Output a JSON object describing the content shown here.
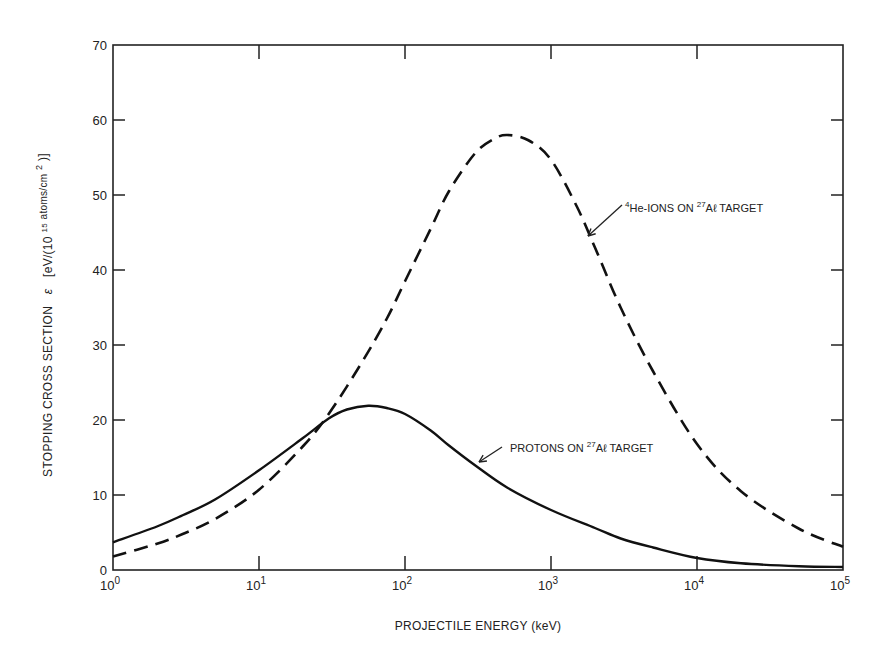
{
  "chart_data": {
    "type": "line",
    "title": "",
    "xlabel": "PROJECTILE ENERGY (keV)",
    "ylabel": "STOPPING CROSS SECTION ε [eV/(10^15 atoms/cm^2)]",
    "ylabel_parts": {
      "main": "STOPPING CROSS SECTION",
      "symbol": "ε",
      "unit_pre": "[eV/(10",
      "unit_exp": "15",
      "unit_mid": " atoms/cm",
      "unit_exp2": "2",
      "unit_post": ")]"
    },
    "xscale": "log",
    "xlim": [
      1,
      100000
    ],
    "ylim": [
      0,
      70
    ],
    "grid": false,
    "x_ticks": [
      {
        "value": 1,
        "base": "10",
        "exp": "0"
      },
      {
        "value": 10,
        "base": "10",
        "exp": "1"
      },
      {
        "value": 100,
        "base": "10",
        "exp": "2"
      },
      {
        "value": 1000,
        "base": "10",
        "exp": "3"
      },
      {
        "value": 10000,
        "base": "10",
        "exp": "4"
      },
      {
        "value": 100000,
        "base": "10",
        "exp": "5"
      }
    ],
    "y_ticks": [
      0,
      10,
      20,
      30,
      40,
      50,
      60,
      70
    ],
    "series": [
      {
        "name": "4He-IONS ON 27Al TARGET",
        "style": "dashed",
        "x": [
          1,
          2,
          3,
          5,
          10,
          20,
          30,
          50,
          75,
          100,
          150,
          200,
          300,
          400,
          500,
          700,
          1000,
          1500,
          2000,
          3000,
          5000,
          10000,
          20000,
          50000,
          100000
        ],
        "y": [
          1.8,
          3.5,
          4.8,
          6.8,
          10.7,
          16.5,
          20.8,
          27.5,
          33.5,
          38.5,
          45.5,
          50.5,
          55.5,
          57.4,
          58.0,
          57.3,
          54.7,
          48.5,
          43.0,
          35.0,
          26.5,
          16.8,
          10.5,
          5.5,
          3.1
        ]
      },
      {
        "name": "PROTONS ON 27Al TARGET",
        "style": "solid",
        "x": [
          1,
          2,
          3,
          5,
          10,
          20,
          30,
          40,
          56,
          75,
          100,
          150,
          200,
          300,
          500,
          1000,
          2000,
          3000,
          5000,
          10000,
          20000,
          50000,
          100000
        ],
        "y": [
          3.7,
          5.8,
          7.3,
          9.4,
          13.3,
          17.6,
          20.2,
          21.4,
          21.9,
          21.6,
          20.8,
          18.6,
          16.6,
          14.0,
          11.0,
          8.0,
          5.6,
          4.2,
          3.0,
          1.6,
          0.9,
          0.5,
          0.4
        ]
      }
    ],
    "annotations": [
      {
        "series": "4He-IONS ON 27Al TARGET",
        "pre_sup": "4",
        "text_a": "He-IONS ON  ",
        "mid_sup": "27",
        "text_b": "Aℓ TARGET",
        "arrow_from": [
          622,
          205
        ],
        "arrow_to": [
          588,
          236
        ],
        "text_pos": [
          625,
          212
        ]
      },
      {
        "series": "PROTONS ON 27Al TARGET",
        "text_a": "PROTONS ON ",
        "mid_sup": "27",
        "text_b": "Aℓ TARGET",
        "arrow_from": [
          502,
          447
        ],
        "arrow_to": [
          479,
          462
        ],
        "text_pos": [
          510,
          452
        ]
      }
    ],
    "legend": null
  },
  "layout": {
    "plot_left": 113,
    "plot_right": 843,
    "plot_top": 45,
    "plot_bottom": 570
  }
}
